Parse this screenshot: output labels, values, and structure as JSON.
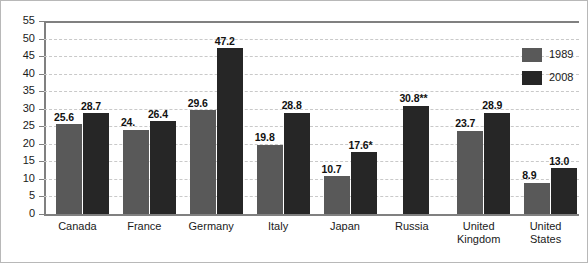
{
  "chart_data": {
    "type": "bar",
    "title": "",
    "subtitle": "",
    "xlabel": "",
    "ylabel": "",
    "ylim": [
      0,
      55
    ],
    "yticks": [
      0,
      5,
      10,
      15,
      20,
      25,
      30,
      35,
      40,
      45,
      50,
      55
    ],
    "grid": true,
    "legend_position": "right",
    "categories": [
      "Canada",
      "France",
      "Germany",
      "Italy",
      "Japan",
      "Russia",
      "United Kingdom",
      "United States"
    ],
    "category_lines": [
      [
        "Canada"
      ],
      [
        "France"
      ],
      [
        "Germany"
      ],
      [
        "Italy"
      ],
      [
        "Japan"
      ],
      [
        "Russia"
      ],
      [
        "United",
        "Kingdom"
      ],
      [
        "United",
        "States"
      ]
    ],
    "series": [
      {
        "name": "1989",
        "color": "#595959",
        "values": [
          25.6,
          24.0,
          29.6,
          19.8,
          10.7,
          null,
          23.7,
          8.9
        ],
        "labels": [
          "25.6",
          "24.",
          "29.6",
          "19.8",
          "10.7",
          "",
          "23.7",
          "8.9"
        ]
      },
      {
        "name": "2008",
        "color": "#262626",
        "values": [
          28.7,
          26.4,
          47.2,
          28.8,
          17.6,
          30.8,
          28.9,
          13.0
        ],
        "labels": [
          "28.7",
          "26.4",
          "47.2",
          "28.8",
          "17.6*",
          "30.8**",
          "28.9",
          "13.0"
        ]
      }
    ]
  },
  "legend": {
    "items": [
      {
        "label": "1989",
        "color": "#595959"
      },
      {
        "label": "2008",
        "color": "#262626"
      }
    ]
  },
  "colors": {
    "series_1989": "#595959",
    "series_2008": "#262626",
    "gridline": "#c9c9c9",
    "axis": "#808080",
    "text": "#1a1a1a",
    "background": "#ffffff",
    "border": "#b8b8b8"
  }
}
